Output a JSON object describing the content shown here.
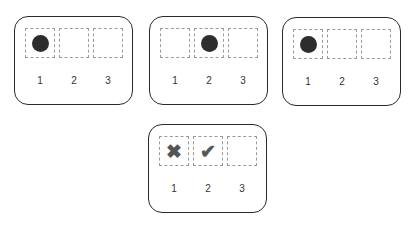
{
  "panels": [
    {
      "id": "panel-1",
      "slots": [
        {
          "label": "1",
          "content": "dot"
        },
        {
          "label": "2",
          "content": "empty"
        },
        {
          "label": "3",
          "content": "empty"
        }
      ]
    },
    {
      "id": "panel-2",
      "slots": [
        {
          "label": "1",
          "content": "empty"
        },
        {
          "label": "2",
          "content": "dot"
        },
        {
          "label": "3",
          "content": "empty"
        }
      ]
    },
    {
      "id": "panel-3",
      "slots": [
        {
          "label": "1",
          "content": "dot"
        },
        {
          "label": "2",
          "content": "empty"
        },
        {
          "label": "3",
          "content": "empty"
        }
      ]
    },
    {
      "id": "panel-4",
      "slots": [
        {
          "label": "1",
          "content": "cross"
        },
        {
          "label": "2",
          "content": "check"
        },
        {
          "label": "3",
          "content": "empty"
        }
      ]
    }
  ],
  "icons": {
    "cross": "✖",
    "check": "✔"
  },
  "colors": {
    "border": "#2a2a2a",
    "dashed": "#9a9a9a",
    "dot": "#2d2d2d",
    "mark": "#555555"
  }
}
